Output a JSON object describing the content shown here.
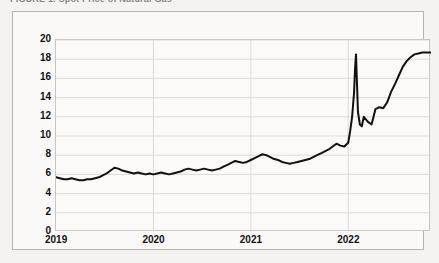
{
  "figure": {
    "title_clipped": "FIGURE 1.  Spot Price of Natural Gas",
    "frame_color": "#b9b5ad",
    "background": "#f4f3f1",
    "panel_background": "#fbfaf8"
  },
  "chart_data": {
    "type": "line",
    "title": "",
    "xlabel": "",
    "ylabel": "",
    "xlim": [
      2019.0,
      2022.85
    ],
    "ylim": [
      0,
      20
    ],
    "grid": true,
    "legend": "none",
    "line_color": "#111111",
    "line_width": 2.0,
    "ytick_labels": [
      "20",
      "18",
      "16",
      "14",
      "12",
      "10",
      "8",
      "6",
      "4",
      "2",
      "0"
    ],
    "ytick_values": [
      20,
      18,
      16,
      14,
      12,
      10,
      8,
      6,
      4,
      2,
      0
    ],
    "xtick_labels": [
      "2019",
      "2020",
      "2021",
      "2022"
    ],
    "xtick_values": [
      2019,
      2020,
      2021,
      2022
    ],
    "series": [
      {
        "name": "price",
        "x": [
          2019.0,
          2019.04,
          2019.08,
          2019.12,
          2019.16,
          2019.2,
          2019.24,
          2019.28,
          2019.32,
          2019.36,
          2019.4,
          2019.44,
          2019.48,
          2019.52,
          2019.56,
          2019.6,
          2019.64,
          2019.68,
          2019.72,
          2019.76,
          2019.8,
          2019.84,
          2019.88,
          2019.92,
          2019.96,
          2020.0,
          2020.04,
          2020.08,
          2020.12,
          2020.16,
          2020.2,
          2020.24,
          2020.28,
          2020.32,
          2020.36,
          2020.4,
          2020.44,
          2020.48,
          2020.52,
          2020.56,
          2020.6,
          2020.64,
          2020.68,
          2020.72,
          2020.76,
          2020.8,
          2020.84,
          2020.88,
          2020.92,
          2020.96,
          2021.0,
          2021.04,
          2021.08,
          2021.12,
          2021.16,
          2021.2,
          2021.24,
          2021.28,
          2021.32,
          2021.36,
          2021.4,
          2021.44,
          2021.48,
          2021.52,
          2021.56,
          2021.6,
          2021.64,
          2021.68,
          2021.72,
          2021.76,
          2021.8,
          2021.84,
          2021.88,
          2021.92,
          2021.96,
          2022.0,
          2022.02,
          2022.04,
          2022.06,
          2022.07,
          2022.08,
          2022.09,
          2022.1,
          2022.12,
          2022.14,
          2022.16,
          2022.2,
          2022.24,
          2022.28,
          2022.32,
          2022.36,
          2022.4,
          2022.44,
          2022.48,
          2022.52,
          2022.56,
          2022.6,
          2022.64,
          2022.68,
          2022.72,
          2022.76,
          2022.8,
          2022.85
        ],
        "y": [
          5.7,
          5.6,
          5.5,
          5.5,
          5.6,
          5.5,
          5.4,
          5.4,
          5.5,
          5.5,
          5.6,
          5.7,
          5.9,
          6.1,
          6.4,
          6.7,
          6.6,
          6.4,
          6.3,
          6.2,
          6.1,
          6.2,
          6.1,
          6.0,
          6.1,
          6.0,
          6.1,
          6.2,
          6.1,
          6.0,
          6.1,
          6.2,
          6.3,
          6.5,
          6.6,
          6.5,
          6.4,
          6.5,
          6.6,
          6.5,
          6.4,
          6.5,
          6.6,
          6.8,
          7.0,
          7.2,
          7.4,
          7.3,
          7.2,
          7.3,
          7.5,
          7.7,
          7.9,
          8.1,
          8.0,
          7.8,
          7.6,
          7.5,
          7.3,
          7.2,
          7.1,
          7.2,
          7.3,
          7.4,
          7.5,
          7.6,
          7.8,
          8.0,
          8.2,
          8.4,
          8.6,
          8.9,
          9.2,
          9.0,
          8.9,
          9.3,
          10.5,
          12.0,
          14.5,
          17.0,
          18.5,
          15.5,
          12.5,
          11.2,
          11.0,
          12.0,
          11.5,
          11.2,
          12.8,
          13.0,
          12.9,
          13.5,
          14.6,
          15.4,
          16.3,
          17.2,
          17.8,
          18.2,
          18.5,
          18.6,
          18.7,
          18.7,
          18.7
        ]
      }
    ]
  }
}
